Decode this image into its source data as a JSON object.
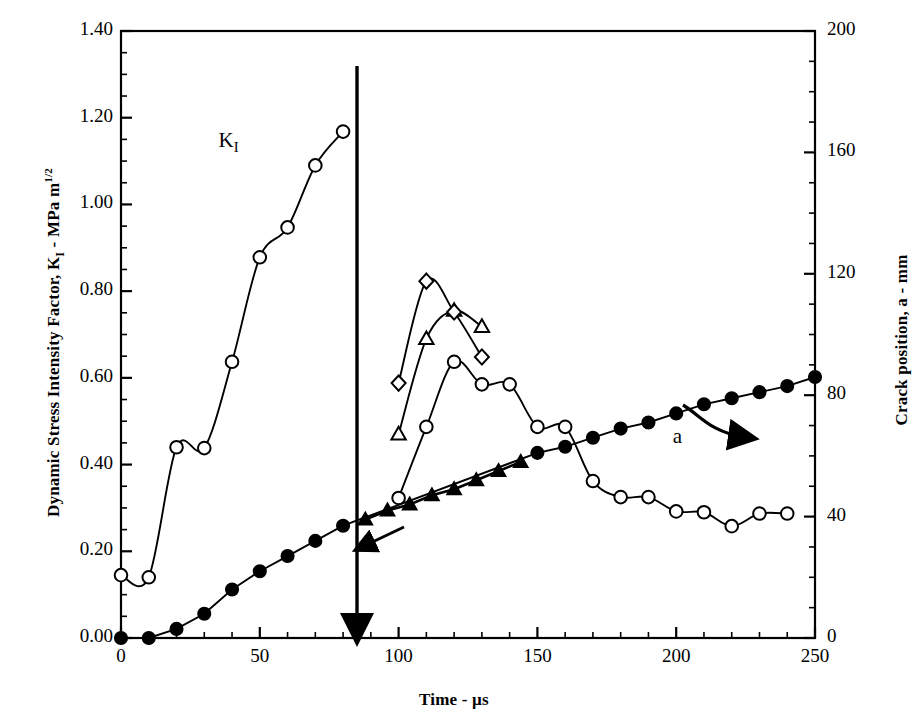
{
  "chart_data": {
    "type": "line",
    "title": "",
    "xlabel": "Time - µs",
    "ylabel_left": "Dynamic Stress Intensity Factor, K",
    "ylabel_left_sub": "I",
    "ylabel_left_tail": " - MPa m",
    "ylabel_left_sup": "1/2",
    "ylabel_right": "Crack position, a - mm",
    "xlim": [
      0,
      250
    ],
    "ylim_left": [
      0.0,
      1.4
    ],
    "ylim_right": [
      0,
      200
    ],
    "grid": false,
    "legend": "none (in-plot annotations)",
    "xticks": [
      0,
      50,
      100,
      150,
      200,
      250
    ],
    "xticklabels": [
      "0",
      "50",
      "100",
      "150",
      "200",
      "250"
    ],
    "xminor_step": 10,
    "yticks_left": [
      0.0,
      0.2,
      0.4,
      0.6,
      0.8,
      1.0,
      1.2,
      1.4
    ],
    "yticklabels_left": [
      "0.00",
      "0.20",
      "0.40",
      "0.60",
      "0.80",
      "1.00",
      "1.20",
      "1.40"
    ],
    "yminor_step_left": 0.05,
    "yticks_right": [
      0,
      40,
      80,
      120,
      160,
      200
    ],
    "yticklabels_right": [
      "0",
      "40",
      "80",
      "120",
      "160",
      "200"
    ],
    "yminor_step_right": 10,
    "annotations": [
      {
        "name": "ki-label",
        "text": "K",
        "sub": "I",
        "x": 38,
        "y": 1.145
      },
      {
        "name": "a-label",
        "text": "a",
        "x": 198,
        "y": 0.462
      },
      {
        "name": "crack-initiation-marker",
        "text": "",
        "x": 87,
        "type": "vertical-arrow",
        "y_from": 1.33,
        "y_to": 0.0
      }
    ],
    "series": [
      {
        "name": "K_I pre-initiation",
        "marker": "open-circle",
        "axis": "left",
        "points": [
          {
            "x": 0,
            "y": 0.145
          },
          {
            "x": 10,
            "y": 0.14
          },
          {
            "x": 20,
            "y": 0.44
          },
          {
            "x": 30,
            "y": 0.438
          },
          {
            "x": 40,
            "y": 0.637
          },
          {
            "x": 50,
            "y": 0.878
          },
          {
            "x": 60,
            "y": 0.947
          },
          {
            "x": 70,
            "y": 1.09
          },
          {
            "x": 80,
            "y": 1.168
          }
        ]
      },
      {
        "name": "K_I post-initiation (circles)",
        "marker": "open-circle",
        "axis": "left",
        "points": [
          {
            "x": 100,
            "y": 0.323
          },
          {
            "x": 110,
            "y": 0.487
          },
          {
            "x": 120,
            "y": 0.637
          },
          {
            "x": 130,
            "y": 0.585
          },
          {
            "x": 140,
            "y": 0.585
          },
          {
            "x": 150,
            "y": 0.487
          },
          {
            "x": 160,
            "y": 0.487
          },
          {
            "x": 170,
            "y": 0.362
          },
          {
            "x": 180,
            "y": 0.325
          },
          {
            "x": 190,
            "y": 0.325
          },
          {
            "x": 200,
            "y": 0.292
          },
          {
            "x": 210,
            "y": 0.29
          },
          {
            "x": 220,
            "y": 0.258
          },
          {
            "x": 230,
            "y": 0.287
          },
          {
            "x": 240,
            "y": 0.287
          }
        ]
      },
      {
        "name": "K_I post-initiation (triangles)",
        "marker": "open-triangle",
        "axis": "left",
        "points": [
          {
            "x": 100,
            "y": 0.47
          },
          {
            "x": 110,
            "y": 0.69
          },
          {
            "x": 120,
            "y": 0.755
          },
          {
            "x": 130,
            "y": 0.718
          }
        ]
      },
      {
        "name": "K_I post-initiation (diamonds)",
        "marker": "open-diamond",
        "axis": "left",
        "points": [
          {
            "x": 100,
            "y": 0.588
          },
          {
            "x": 110,
            "y": 0.823
          },
          {
            "x": 120,
            "y": 0.752
          },
          {
            "x": 130,
            "y": 0.648
          }
        ]
      },
      {
        "name": "Crack position a (filled circles)",
        "marker": "filled-circle",
        "axis": "right",
        "points": [
          {
            "x": 0,
            "y": 0
          },
          {
            "x": 10,
            "y": 0
          },
          {
            "x": 20,
            "y": 3
          },
          {
            "x": 30,
            "y": 8
          },
          {
            "x": 40,
            "y": 16
          },
          {
            "x": 50,
            "y": 22
          },
          {
            "x": 60,
            "y": 27
          },
          {
            "x": 70,
            "y": 32
          },
          {
            "x": 80,
            "y": 37
          },
          {
            "x": 150,
            "y": 61
          },
          {
            "x": 160,
            "y": 63
          },
          {
            "x": 170,
            "y": 66
          },
          {
            "x": 180,
            "y": 69
          },
          {
            "x": 190,
            "y": 71
          },
          {
            "x": 200,
            "y": 74
          },
          {
            "x": 210,
            "y": 77
          },
          {
            "x": 220,
            "y": 79
          },
          {
            "x": 230,
            "y": 81
          },
          {
            "x": 240,
            "y": 83
          },
          {
            "x": 250,
            "y": 86
          }
        ]
      },
      {
        "name": "Crack position a (filled triangles segment)",
        "marker": "filled-triangle",
        "axis": "right",
        "points": [
          {
            "x": 88,
            "y": 39
          },
          {
            "x": 96,
            "y": 42
          },
          {
            "x": 104,
            "y": 44
          },
          {
            "x": 112,
            "y": 47
          },
          {
            "x": 120,
            "y": 49
          },
          {
            "x": 128,
            "y": 52
          },
          {
            "x": 136,
            "y": 55
          },
          {
            "x": 144,
            "y": 58
          }
        ]
      }
    ]
  }
}
